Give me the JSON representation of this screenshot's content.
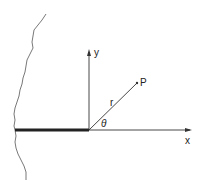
{
  "diagram": {
    "labels": {
      "y_axis": "y",
      "x_axis": "x",
      "point": "P",
      "radius": "r",
      "angle": "θ"
    },
    "colors": {
      "line": "#333333",
      "crack": "#222222",
      "boundary": "#555555"
    }
  }
}
